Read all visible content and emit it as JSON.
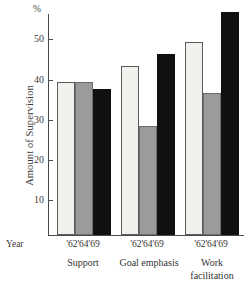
{
  "chart_data": {
    "type": "bar",
    "title": "",
    "subtitle": "",
    "xlabel": "Year",
    "ylabel": "Amount of Supervision",
    "yunit": "%",
    "ylim": [
      0,
      56
    ],
    "ytick_values": [
      10,
      20,
      30,
      40,
      50
    ],
    "ytick_labels": [
      "10",
      "20",
      "30",
      "40",
      "50"
    ],
    "grid": false,
    "legend_position": "none",
    "categories": [
      "Support",
      "Goal emphasis",
      "Work facilitation"
    ],
    "x": [
      "'62",
      "'64",
      "'69"
    ],
    "series": [
      {
        "name": "'62",
        "color": "#f1f0ec",
        "values": [
          38,
          42,
          48
        ]
      },
      {
        "name": "'64",
        "color": "#9b9b9b",
        "values": [
          38,
          27,
          35.2
        ]
      },
      {
        "name": "'69",
        "color": "#101010",
        "values": [
          36.2,
          45,
          55.3
        ]
      }
    ]
  },
  "axis": {
    "percent_symbol": "%",
    "y_title": "Amount of Supervision",
    "year_caption": "Year",
    "tick_50": "50",
    "tick_40": "40",
    "tick_30": "30",
    "tick_20": "20",
    "tick_10": "10"
  },
  "groups": [
    {
      "label": "Support",
      "years": "'62'64'69"
    },
    {
      "label": "Goal emphasis",
      "years": "'62'64'69"
    },
    {
      "label": "Work\nfacilitation",
      "years": "'62'64'69"
    }
  ]
}
